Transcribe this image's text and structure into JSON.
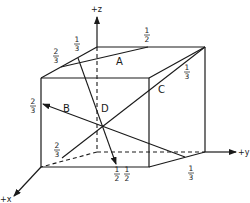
{
  "figure": {
    "axes": {
      "z": {
        "label": "+z"
      },
      "y": {
        "label": "+y"
      },
      "x": {
        "label": "+x"
      }
    },
    "vectors": [
      {
        "label": "A"
      },
      {
        "label": "B"
      },
      {
        "label": "C"
      },
      {
        "label": "D"
      }
    ],
    "fractions": [
      {
        "id": "top-left-2-3",
        "num": "2",
        "den": "3"
      },
      {
        "id": "top-left-1-3",
        "num": "1",
        "den": "3"
      },
      {
        "id": "top-back-1-2",
        "num": "1",
        "den": "2"
      },
      {
        "id": "top-right-1-3",
        "num": "1",
        "den": "3"
      },
      {
        "id": "left-front-2-3",
        "num": "2",
        "den": "3"
      },
      {
        "id": "bottom-left-2-3",
        "num": "2",
        "den": "3"
      },
      {
        "id": "bottom-front-1-2-a",
        "num": "1",
        "den": "2"
      },
      {
        "id": "bottom-front-1-2-b",
        "num": "1",
        "den": "2"
      },
      {
        "id": "bottom-right-1-3",
        "num": "1",
        "den": "3"
      }
    ]
  }
}
